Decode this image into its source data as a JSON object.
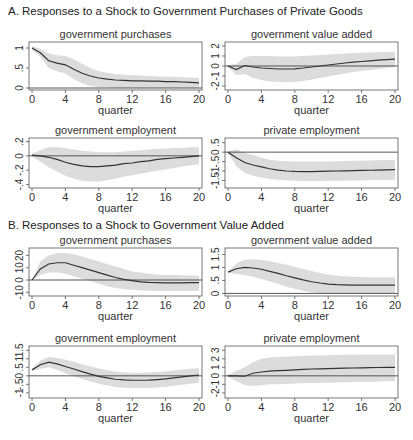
{
  "sections": [
    {
      "label": "A. Responses to a Shock to Government Purchases of Private Goods"
    },
    {
      "label": "B. Responses to a Shock to Government Value Added"
    }
  ],
  "chart_data": [
    {
      "type": "line",
      "section": "A",
      "title": "government purchases",
      "xlabel": "quarter",
      "x": [
        0,
        1,
        2,
        3,
        4,
        5,
        6,
        7,
        8,
        9,
        10,
        11,
        12,
        13,
        14,
        15,
        16,
        17,
        18,
        19,
        20
      ],
      "xticks": [
        0,
        4,
        8,
        12,
        16,
        20
      ],
      "yticks": [
        0,
        0.5,
        1
      ],
      "ytick_labels": [
        "0",
        ".5",
        "1"
      ],
      "ylim": [
        -0.05,
        1.15
      ],
      "series": [
        {
          "name": "response",
          "values": [
            1.0,
            0.88,
            0.68,
            0.62,
            0.58,
            0.47,
            0.37,
            0.3,
            0.25,
            0.22,
            0.2,
            0.19,
            0.18,
            0.18,
            0.17,
            0.17,
            0.16,
            0.16,
            0.15,
            0.14,
            0.13
          ]
        },
        {
          "name": "upper band",
          "values": [
            1.05,
            0.98,
            0.86,
            0.82,
            0.8,
            0.72,
            0.6,
            0.5,
            0.42,
            0.38,
            0.35,
            0.33,
            0.32,
            0.31,
            0.3,
            0.29,
            0.28,
            0.28,
            0.27,
            0.26,
            0.25
          ]
        },
        {
          "name": "lower band",
          "values": [
            0.95,
            0.78,
            0.5,
            0.42,
            0.36,
            0.22,
            0.12,
            0.05,
            0.02,
            0.01,
            0.0,
            0.0,
            0.0,
            0.0,
            0.0,
            0.0,
            0.0,
            0.0,
            0.0,
            0.0,
            0.0
          ]
        }
      ],
      "zero_line": true
    },
    {
      "type": "line",
      "section": "A",
      "title": "government value added",
      "xlabel": "quarter",
      "x": [
        0,
        1,
        2,
        3,
        4,
        5,
        6,
        7,
        8,
        9,
        10,
        11,
        12,
        13,
        14,
        15,
        16,
        17,
        18,
        19,
        20
      ],
      "xticks": [
        0,
        4,
        8,
        12,
        16,
        20
      ],
      "yticks": [
        -2,
        -1,
        0,
        1,
        2
      ],
      "ytick_labels": [
        "-2",
        "-1",
        "0",
        "1",
        "2"
      ],
      "ylim": [
        -2.4,
        2.4
      ],
      "series": [
        {
          "name": "response",
          "values": [
            0.0,
            -0.35,
            0.05,
            -0.1,
            -0.2,
            -0.25,
            -0.3,
            -0.3,
            -0.28,
            -0.2,
            -0.1,
            0.0,
            0.1,
            0.2,
            0.3,
            0.38,
            0.45,
            0.52,
            0.58,
            0.63,
            0.68
          ]
        },
        {
          "name": "upper band",
          "values": [
            0.1,
            0.2,
            0.9,
            1.0,
            1.0,
            1.0,
            0.95,
            0.95,
            0.95,
            1.0,
            1.05,
            1.1,
            1.15,
            1.2,
            1.25,
            1.3,
            1.32,
            1.35,
            1.38,
            1.4,
            1.42
          ]
        },
        {
          "name": "lower band",
          "values": [
            -0.1,
            -0.9,
            -0.8,
            -1.2,
            -1.4,
            -1.55,
            -1.6,
            -1.62,
            -1.6,
            -1.5,
            -1.35,
            -1.2,
            -1.05,
            -0.9,
            -0.75,
            -0.6,
            -0.5,
            -0.4,
            -0.3,
            -0.2,
            -0.1
          ]
        }
      ],
      "zero_line": true
    },
    {
      "type": "line",
      "section": "A",
      "title": "government employment",
      "xlabel": "quarter",
      "x": [
        0,
        1,
        2,
        3,
        4,
        5,
        6,
        7,
        8,
        9,
        10,
        11,
        12,
        13,
        14,
        15,
        16,
        17,
        18,
        19,
        20
      ],
      "xticks": [
        0,
        4,
        8,
        12,
        16,
        20
      ],
      "yticks": [
        -0.4,
        -0.2,
        0,
        0.2
      ],
      "ytick_labels": [
        "-.4",
        "-.2",
        "0",
        ".2"
      ],
      "ylim": [
        -0.45,
        0.25
      ],
      "series": [
        {
          "name": "response",
          "values": [
            0.01,
            0.0,
            -0.02,
            -0.05,
            -0.09,
            -0.12,
            -0.14,
            -0.15,
            -0.15,
            -0.14,
            -0.13,
            -0.11,
            -0.1,
            -0.08,
            -0.07,
            -0.05,
            -0.04,
            -0.03,
            -0.02,
            -0.01,
            0.0
          ]
        },
        {
          "name": "upper band",
          "values": [
            0.03,
            0.08,
            0.12,
            0.12,
            0.11,
            0.09,
            0.07,
            0.06,
            0.05,
            0.05,
            0.05,
            0.06,
            0.07,
            0.08,
            0.09,
            0.1,
            0.1,
            0.11,
            0.11,
            0.12,
            0.12
          ]
        },
        {
          "name": "lower band",
          "values": [
            -0.01,
            -0.08,
            -0.16,
            -0.22,
            -0.28,
            -0.32,
            -0.35,
            -0.36,
            -0.36,
            -0.34,
            -0.32,
            -0.29,
            -0.27,
            -0.25,
            -0.23,
            -0.21,
            -0.19,
            -0.17,
            -0.15,
            -0.13,
            -0.12
          ]
        }
      ],
      "zero_line": true
    },
    {
      "type": "line",
      "section": "A",
      "title": "private employment",
      "xlabel": "quarter",
      "x": [
        0,
        1,
        2,
        3,
        4,
        5,
        6,
        7,
        8,
        9,
        10,
        11,
        12,
        13,
        14,
        15,
        16,
        17,
        18,
        19,
        20
      ],
      "xticks": [
        0,
        4,
        8,
        12,
        16,
        20
      ],
      "yticks": [
        -1.5,
        -1,
        -0.5,
        0,
        0.5
      ],
      "ytick_labels": [
        "-1.5",
        "-1",
        "-.5",
        "0",
        ".5"
      ],
      "ylim": [
        -1.9,
        0.75
      ],
      "series": [
        {
          "name": "response",
          "values": [
            0.0,
            -0.3,
            -0.55,
            -0.68,
            -0.78,
            -0.88,
            -0.95,
            -1.0,
            -1.02,
            -1.03,
            -1.03,
            -1.02,
            -1.01,
            -1.0,
            -0.99,
            -0.98,
            -0.97,
            -0.96,
            -0.95,
            -0.94,
            -0.93
          ]
        },
        {
          "name": "upper band",
          "values": [
            0.05,
            0.15,
            -0.05,
            -0.15,
            -0.3,
            -0.4,
            -0.45,
            -0.48,
            -0.5,
            -0.5,
            -0.5,
            -0.5,
            -0.49,
            -0.48,
            -0.47,
            -0.46,
            -0.45,
            -0.44,
            -0.43,
            -0.42,
            -0.41
          ]
        },
        {
          "name": "lower band",
          "values": [
            -0.05,
            -0.75,
            -1.1,
            -1.25,
            -1.35,
            -1.42,
            -1.46,
            -1.5,
            -1.52,
            -1.53,
            -1.53,
            -1.53,
            -1.52,
            -1.52,
            -1.51,
            -1.5,
            -1.5,
            -1.49,
            -1.48,
            -1.47,
            -1.46
          ]
        }
      ],
      "zero_line": true
    },
    {
      "type": "line",
      "section": "B",
      "title": "government purchases",
      "xlabel": "quarter",
      "x": [
        0,
        1,
        2,
        3,
        4,
        5,
        6,
        7,
        8,
        9,
        10,
        11,
        12,
        13,
        14,
        15,
        16,
        17,
        18,
        19,
        20
      ],
      "xticks": [
        0,
        4,
        8,
        12,
        16,
        20
      ],
      "yticks": [
        -10,
        0,
        10,
        20
      ],
      "ytick_labels": [
        "-10",
        "0",
        "10",
        "20"
      ],
      "ylim": [
        -13,
        26
      ],
      "series": [
        {
          "name": "response",
          "values": [
            0,
            9,
            13,
            14,
            14,
            12,
            10,
            8,
            6,
            4,
            2,
            0.5,
            -0.5,
            -1.5,
            -2,
            -2.2,
            -2.3,
            -2.3,
            -2.3,
            -2.2,
            -2.2
          ]
        },
        {
          "name": "upper band",
          "values": [
            0,
            15,
            20,
            22,
            22,
            21,
            19,
            17,
            15,
            13,
            11,
            9,
            7,
            6,
            5,
            4.5,
            4,
            4,
            3.8,
            3.7,
            3.5
          ]
        },
        {
          "name": "lower band",
          "values": [
            0,
            4,
            6,
            6,
            5,
            3,
            1,
            -1,
            -3,
            -5,
            -6.5,
            -7.5,
            -8,
            -8.5,
            -8.8,
            -9,
            -9,
            -9,
            -9,
            -8.9,
            -8.8
          ]
        }
      ],
      "zero_line": true
    },
    {
      "type": "line",
      "section": "B",
      "title": "government value added",
      "xlabel": "quarter",
      "x": [
        0,
        1,
        2,
        3,
        4,
        5,
        6,
        7,
        8,
        9,
        10,
        11,
        12,
        13,
        14,
        15,
        16,
        17,
        18,
        19,
        20
      ],
      "xticks": [
        0,
        4,
        8,
        12,
        16,
        20
      ],
      "yticks": [
        0,
        0.5,
        1,
        1.5
      ],
      "ytick_labels": [
        "0",
        ".5",
        "1",
        "1.5"
      ],
      "ylim": [
        -0.1,
        1.75
      ],
      "series": [
        {
          "name": "response",
          "values": [
            0.82,
            0.95,
            1.0,
            0.98,
            0.93,
            0.85,
            0.77,
            0.68,
            0.6,
            0.52,
            0.45,
            0.4,
            0.36,
            0.34,
            0.33,
            0.32,
            0.32,
            0.32,
            0.32,
            0.32,
            0.32
          ]
        },
        {
          "name": "upper band",
          "values": [
            0.84,
            1.15,
            1.3,
            1.32,
            1.3,
            1.24,
            1.17,
            1.1,
            1.02,
            0.94,
            0.86,
            0.79,
            0.73,
            0.69,
            0.66,
            0.64,
            0.63,
            0.62,
            0.62,
            0.62,
            0.62
          ]
        },
        {
          "name": "lower band",
          "values": [
            0.8,
            0.75,
            0.7,
            0.64,
            0.56,
            0.46,
            0.37,
            0.26,
            0.18,
            0.1,
            0.04,
            0.01,
            0.0,
            0.0,
            0.0,
            0.0,
            0.0,
            0.0,
            0.0,
            0.0,
            0.0
          ]
        }
      ],
      "zero_line": true
    },
    {
      "type": "line",
      "section": "B",
      "title": "government employment",
      "xlabel": "quarter",
      "x": [
        0,
        1,
        2,
        3,
        4,
        5,
        6,
        7,
        8,
        9,
        10,
        11,
        12,
        13,
        14,
        15,
        16,
        17,
        18,
        19,
        20
      ],
      "xticks": [
        0,
        4,
        8,
        12,
        16,
        20
      ],
      "yticks": [
        -1,
        -0.5,
        0,
        0.5,
        1,
        1.5
      ],
      "ytick_labels": [
        "-1",
        "-.5",
        "0",
        ".5",
        "1",
        "1.5"
      ],
      "ylim": [
        -1.3,
        1.75
      ],
      "series": [
        {
          "name": "response",
          "values": [
            0.35,
            0.65,
            0.8,
            0.7,
            0.55,
            0.4,
            0.25,
            0.1,
            -0.03,
            -0.12,
            -0.2,
            -0.24,
            -0.26,
            -0.26,
            -0.25,
            -0.22,
            -0.18,
            -0.12,
            -0.06,
            0.0,
            0.05
          ]
        },
        {
          "name": "upper band",
          "values": [
            0.4,
            0.9,
            1.1,
            1.05,
            0.95,
            0.82,
            0.68,
            0.55,
            0.43,
            0.33,
            0.25,
            0.2,
            0.18,
            0.18,
            0.2,
            0.23,
            0.27,
            0.32,
            0.37,
            0.42,
            0.45
          ]
        },
        {
          "name": "lower band",
          "values": [
            0.3,
            0.4,
            0.5,
            0.35,
            0.15,
            -0.02,
            -0.18,
            -0.33,
            -0.46,
            -0.57,
            -0.65,
            -0.7,
            -0.72,
            -0.72,
            -0.71,
            -0.68,
            -0.64,
            -0.58,
            -0.52,
            -0.46,
            -0.4
          ]
        }
      ],
      "zero_line": true
    },
    {
      "type": "line",
      "section": "B",
      "title": "private employment",
      "xlabel": "quarter",
      "x": [
        0,
        1,
        2,
        3,
        4,
        5,
        6,
        7,
        8,
        9,
        10,
        11,
        12,
        13,
        14,
        15,
        16,
        17,
        18,
        19,
        20
      ],
      "xticks": [
        0,
        4,
        8,
        12,
        16,
        20
      ],
      "yticks": [
        -2,
        -1,
        0,
        1,
        2,
        3
      ],
      "ytick_labels": [
        "-2",
        "-1",
        "0",
        "1",
        "2",
        "3"
      ],
      "ylim": [
        -2.6,
        3.5
      ],
      "series": [
        {
          "name": "response",
          "values": [
            0.0,
            0.0,
            -0.05,
            0.3,
            0.45,
            0.55,
            0.6,
            0.65,
            0.7,
            0.75,
            0.8,
            0.82,
            0.85,
            0.88,
            0.9,
            0.92,
            0.94,
            0.96,
            0.98,
            0.99,
            1.0
          ]
        },
        {
          "name": "upper band",
          "values": [
            0.1,
            0.6,
            1.0,
            1.6,
            2.0,
            2.15,
            2.2,
            2.25,
            2.3,
            2.35,
            2.38,
            2.4,
            2.42,
            2.44,
            2.46,
            2.48,
            2.5,
            2.5,
            2.5,
            2.5,
            2.5
          ]
        },
        {
          "name": "lower band",
          "values": [
            -0.1,
            -0.6,
            -1.1,
            -1.2,
            -1.1,
            -1.0,
            -1.0,
            -0.95,
            -0.9,
            -0.88,
            -0.85,
            -0.82,
            -0.8,
            -0.78,
            -0.75,
            -0.72,
            -0.7,
            -0.68,
            -0.66,
            -0.64,
            -0.62
          ]
        }
      ],
      "zero_line": true
    }
  ]
}
